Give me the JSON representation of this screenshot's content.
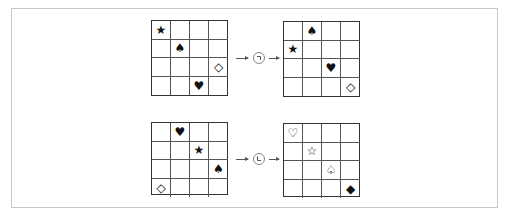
{
  "rows": [
    {
      "input_grid": {
        "size": 4,
        "cells": [
          {
            "row": 0,
            "col": 0,
            "symbol": "★",
            "name": "star-filled-icon"
          },
          {
            "row": 1,
            "col": 1,
            "symbol": "♠",
            "name": "spade-filled-icon"
          },
          {
            "row": 2,
            "col": 3,
            "symbol": "◇",
            "name": "diamond-outline-icon"
          },
          {
            "row": 3,
            "col": 2,
            "symbol": "♥",
            "name": "heart-filled-icon"
          }
        ]
      },
      "operator": {
        "name": "rotate-corner-top-right-icon",
        "glyph": "top-right-corner"
      },
      "output_grid": {
        "size": 4,
        "cells": [
          {
            "row": 0,
            "col": 1,
            "symbol": "♠",
            "name": "spade-filled-icon"
          },
          {
            "row": 1,
            "col": 0,
            "symbol": "★",
            "name": "star-filled-icon"
          },
          {
            "row": 2,
            "col": 2,
            "symbol": "♥",
            "name": "heart-filled-icon"
          },
          {
            "row": 3,
            "col": 3,
            "symbol": "◇",
            "name": "diamond-outline-icon"
          }
        ]
      }
    },
    {
      "input_grid": {
        "size": 4,
        "cells": [
          {
            "row": 0,
            "col": 1,
            "symbol": "♥",
            "name": "heart-filled-icon"
          },
          {
            "row": 1,
            "col": 2,
            "symbol": "★",
            "name": "star-filled-icon"
          },
          {
            "row": 2,
            "col": 3,
            "symbol": "♠",
            "name": "spade-filled-icon"
          },
          {
            "row": 3,
            "col": 0,
            "symbol": "◇",
            "name": "diamond-outline-icon"
          }
        ]
      },
      "operator": {
        "name": "corner-bottom-left-icon",
        "glyph": "bottom-left-corner"
      },
      "output_grid": {
        "size": 4,
        "cells": [
          {
            "row": 0,
            "col": 0,
            "symbol": "♡",
            "name": "heart-outline-icon"
          },
          {
            "row": 1,
            "col": 1,
            "symbol": "☆",
            "name": "star-outline-icon"
          },
          {
            "row": 2,
            "col": 2,
            "symbol": "♤",
            "name": "spade-outline-icon"
          },
          {
            "row": 3,
            "col": 3,
            "symbol": "◆",
            "name": "diamond-filled-icon"
          }
        ]
      }
    }
  ],
  "colors": {
    "grid_line": "#555555",
    "frame": "#c8c8c8",
    "symbol": "#111111"
  }
}
